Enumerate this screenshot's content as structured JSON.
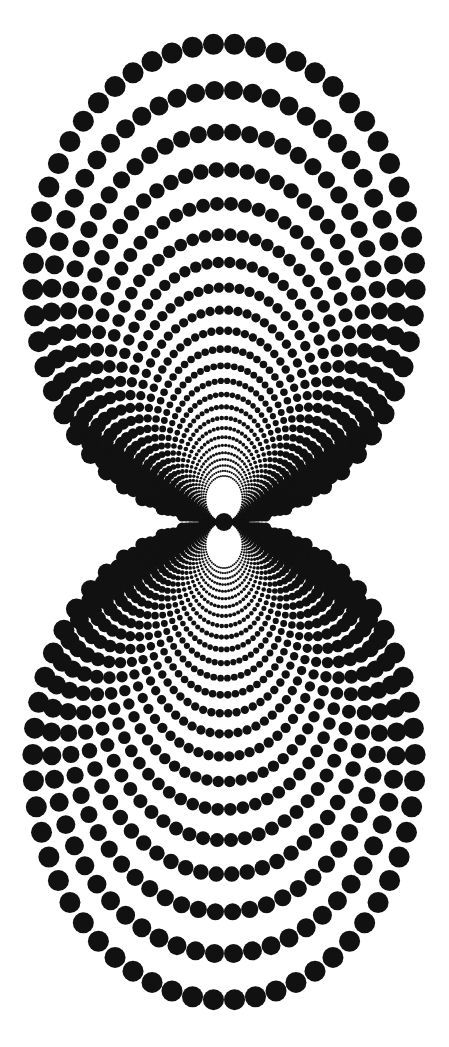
{
  "figure": {
    "background": "#ffffff",
    "dot_color": "#111111",
    "pinch_point": {
      "x": 224,
      "y": 522
    },
    "lobes": [
      {
        "name": "upper",
        "extent_y": [
          45,
          522
        ],
        "extent_x": [
          35,
          412
        ]
      },
      {
        "name": "lower",
        "extent_y": [
          522,
          1010
        ],
        "extent_x": [
          35,
          412
        ]
      }
    ],
    "rings": 24,
    "max_dot_radius": 10.5,
    "x_scale": 0.8
  }
}
